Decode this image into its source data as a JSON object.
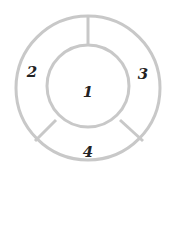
{
  "diagram": {
    "stroke_color": "#c8c8c8",
    "text_color": "#222222",
    "regions": [
      {
        "id": "center",
        "label": "1"
      },
      {
        "id": "left",
        "label": "2"
      },
      {
        "id": "right",
        "label": "3"
      },
      {
        "id": "bottom",
        "label": "4"
      }
    ]
  }
}
